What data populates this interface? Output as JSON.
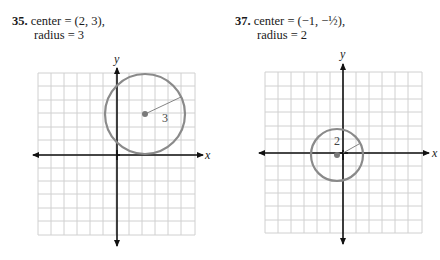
{
  "problems": [
    {
      "number": "35.",
      "line1": "center = (2, 3),",
      "line2": "radius = 3",
      "radius_label": "3",
      "center": [
        2,
        3
      ],
      "radius": 3
    },
    {
      "number": "37.",
      "line1": "center = (−1, −½),",
      "line2": "radius = 2",
      "radius_label": "2",
      "center": [
        -1,
        -0.5
      ],
      "radius": 2
    }
  ],
  "axes": {
    "x_label": "x",
    "y_label": "y"
  },
  "colors": {
    "grid": "#d0d0d0",
    "axis": "#111111",
    "circle": "#8a8a8a",
    "center_dot": "#7a7a7a"
  }
}
